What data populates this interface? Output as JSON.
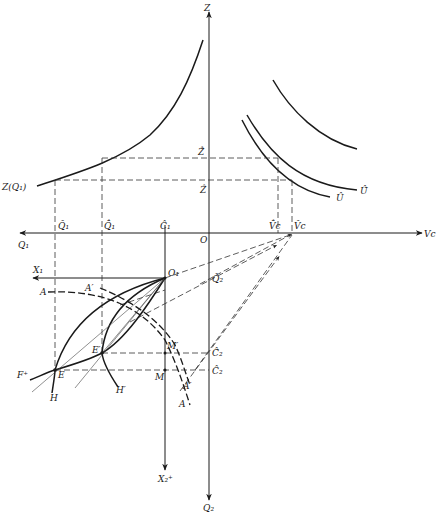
{
  "diagram": {
    "type": "economics geometric construction (production/consumption with Edgeworth box)",
    "axes": {
      "vertical_up": "Z",
      "vertical_down": "Q₂",
      "horizontal_right": "Vc",
      "horizontal_left": "Q₁",
      "origin": "O",
      "box_origin": "O₁",
      "box_x_axis": "X₁",
      "box_y_axis": "X₂⁺"
    },
    "curves": {
      "production": "Z(Q₁)",
      "utility_low": "Û",
      "utility_high": "Û̂",
      "contract_A": "A",
      "contract_A_prime": "A′",
      "curve_H": "H",
      "curve_H_prime": "H′",
      "curve_F": "F⁺"
    },
    "points": {
      "E": "E",
      "E_prime": "E′",
      "M": "M",
      "M_prime": "M′"
    },
    "tick_labels": {
      "Q1_hat": "Q̂₁",
      "Q1_dhat": "Q̂̂₁",
      "C1_hat": "Ĉ₁",
      "Vc_dhat": "V̂̂c",
      "Vc_hat": "V̂c",
      "Z_hat": "Ẑ",
      "Z_dhat": "Ẑ̂",
      "Q2_hat": "Q̂₂",
      "C2_dhat": "Ĉ̂₂",
      "C2_hat": "Ĉ₂"
    },
    "colors": {
      "ink": "#1a1a1a",
      "background": "#ffffff"
    }
  }
}
